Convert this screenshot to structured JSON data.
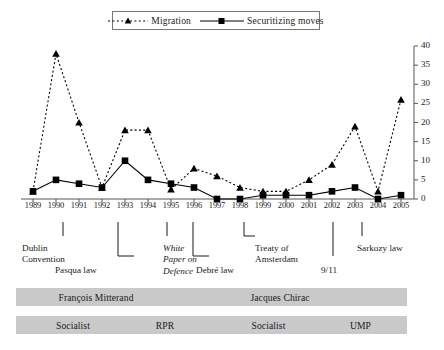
{
  "chart_data": {
    "type": "line",
    "title": "",
    "xlabel": "",
    "ylabel": "",
    "ylim": [
      0,
      40
    ],
    "ytick_step": 5,
    "yticks": [
      0,
      5,
      10,
      15,
      20,
      25,
      30,
      35,
      40
    ],
    "grid": false,
    "legend_position": "top-center",
    "axis_position": "right",
    "categories": [
      1989,
      1990,
      1991,
      1992,
      1993,
      1994,
      1995,
      1996,
      1997,
      1998,
      1999,
      2000,
      2001,
      2002,
      2003,
      2004,
      2005
    ],
    "series": [
      {
        "name": "Migration",
        "marker": "triangle",
        "line_style": "dotted",
        "color": "#000000",
        "values": [
          2,
          38,
          20,
          3,
          18,
          18,
          2.5,
          8,
          6,
          3,
          2,
          2,
          5,
          9,
          19,
          2,
          26
        ]
      },
      {
        "name": "Securitizing moves",
        "marker": "square",
        "line_style": "solid",
        "color": "#000000",
        "values": [
          2,
          5,
          4,
          3,
          10,
          5,
          4,
          3,
          0,
          0,
          1,
          1,
          1,
          2,
          3,
          0,
          1
        ]
      }
    ],
    "annotations": [
      {
        "label": "Dublin\nConvention",
        "year": 1990,
        "connector": "tick",
        "italic": false
      },
      {
        "label": "Pasqua law",
        "year": 1993,
        "connector": "bracket-left",
        "italic": false
      },
      {
        "label": "White\nPaper on\nDefence",
        "year": 1994,
        "connector": "tick",
        "italic": true
      },
      {
        "label": "Debré law",
        "year": 1997,
        "connector": "bracket-left",
        "italic": false
      },
      {
        "label": "Treaty of\nAmsterdam",
        "year": 1997,
        "connector": "bracket-right",
        "italic": false
      },
      {
        "label": "9/11",
        "year": 2001,
        "connector": "tick-long",
        "italic": false
      },
      {
        "label": "Sarkozy law",
        "year": 2002,
        "connector": "tick",
        "italic": false
      }
    ],
    "president_bars": [
      {
        "label": "François Mitterand",
        "start_year": 1989,
        "end_year": 1995
      },
      {
        "label": "Jacques Chirac",
        "start_year": 1995,
        "end_year": 2005
      }
    ],
    "party_bars": [
      {
        "label": "Socialist",
        "start_year": 1989,
        "end_year": 1993
      },
      {
        "label": "RPR",
        "start_year": 1993,
        "end_year": 1997
      },
      {
        "label": "Socialist",
        "start_year": 1997,
        "end_year": 2002
      },
      {
        "label": "UMP",
        "start_year": 2002,
        "end_year": 2005
      }
    ]
  },
  "legend": {
    "entries": [
      {
        "label": "Migration",
        "marker": "triangle",
        "style": "dotted"
      },
      {
        "label": "Securitizing moves",
        "marker": "square",
        "style": "solid"
      }
    ]
  },
  "colors": {
    "bar_fill": "#c9c9c9",
    "axis": "#555555",
    "ink": "#1a1a1a"
  }
}
